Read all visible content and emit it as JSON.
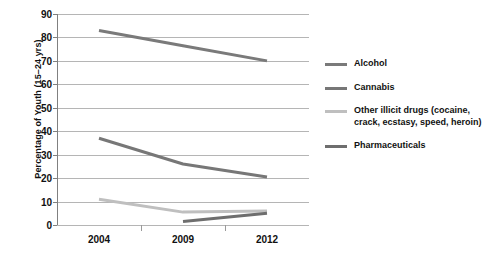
{
  "chart_data": {
    "type": "line",
    "title": "",
    "subtitle": "",
    "xlabel": "",
    "ylabel": "Percentage of Youth (15–24 yrs)",
    "categories": [
      "2004",
      "2009",
      "2012"
    ],
    "x_tick_labels": [
      "2004",
      "2009",
      "2012"
    ],
    "y_tick_labels": [
      "0",
      "10",
      "20",
      "30",
      "40",
      "50",
      "60",
      "70",
      "80",
      "90"
    ],
    "y_ticks": [
      0,
      10,
      20,
      30,
      40,
      50,
      60,
      70,
      80,
      90
    ],
    "ylim": [
      0,
      90
    ],
    "grid": "horizontal",
    "legend_position": "right",
    "series": [
      {
        "name": "Alcohol",
        "legend_label": "Alcohol",
        "color": "#7a7a7a",
        "values": [
          83,
          76.5,
          70
        ]
      },
      {
        "name": "Cannabis",
        "legend_label": "Cannabis",
        "color": "#777777",
        "values": [
          37,
          26,
          20.5
        ]
      },
      {
        "name": "Other illicit drugs",
        "legend_label": "Other illicit drugs (cocaine, crack, ecstasy, speed, heroin)",
        "color": "#bfbfbf",
        "values": [
          11,
          5.5,
          6
        ]
      },
      {
        "name": "Pharmaceuticals",
        "legend_label": "Pharmaceuticals",
        "color": "#6e6e6e",
        "values": [
          null,
          1.5,
          5
        ]
      }
    ]
  },
  "colors": {
    "background": "#ffffff",
    "gridline": "#b5b5b5",
    "axis": "#808080",
    "text": "#111111"
  }
}
